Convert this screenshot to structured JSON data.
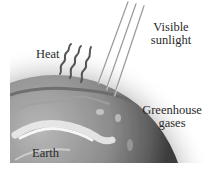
{
  "diagram": {
    "type": "illustration",
    "labels": {
      "sunlight": "Visible\nsunlight",
      "sunlight_line1": "Visible",
      "sunlight_line2": "sunlight",
      "heat": "Heat",
      "greenhouse_line1": "Greenhouse",
      "greenhouse_line2": "gases",
      "earth": "Earth"
    },
    "elements": [
      {
        "id": "earth",
        "shape": "sphere",
        "label": "Earth"
      },
      {
        "id": "atmosphere",
        "shape": "haze-gradient",
        "label": "Greenhouse gases"
      },
      {
        "id": "sun-rays",
        "shape": "parallel-lines",
        "count": 3,
        "direction": "from top-right down to surface",
        "label": "Visible sunlight"
      },
      {
        "id": "heat-waves",
        "shape": "wavy-lines",
        "count": 3,
        "direction": "rising from surface",
        "label": "Heat"
      }
    ],
    "colors": {
      "background": "#ffffff",
      "earth_dark": "#4a4a4a",
      "earth_mid": "#8a8a8a",
      "earth_light": "#d8d8d8",
      "atmosphere": "#cfcfcf",
      "text": "#2a2a2a"
    }
  }
}
